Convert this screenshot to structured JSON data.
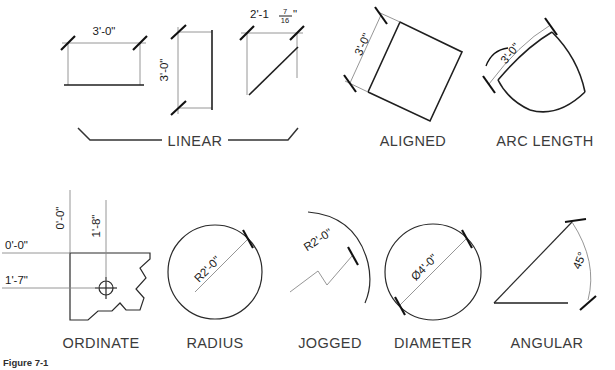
{
  "figure": {
    "caption": "Figure 7-1",
    "rows": [
      {
        "row_name": "top-row",
        "groups": [
          {
            "label": "LINEAR",
            "name": "linear",
            "dimensions": [
              {
                "value": "3'-0\"",
                "orientation": "horizontal",
                "name": "linear-horizontal-dim"
              },
              {
                "value": "3'-0\"",
                "orientation": "vertical",
                "name": "linear-vertical-dim"
              },
              {
                "value": "2'-1",
                "fraction_numerator": "7",
                "fraction_denominator": "16",
                "suffix": "\"",
                "orientation": "horizontal",
                "name": "linear-diagonal-dim"
              }
            ]
          },
          {
            "label": "ALIGNED",
            "name": "aligned",
            "dimensions": [
              {
                "value": "3'-0\"",
                "orientation": "rotated",
                "name": "aligned-dim"
              }
            ]
          },
          {
            "label": "ARC LENGTH",
            "name": "arc-length",
            "dimensions": [
              {
                "value": "3'-0\"",
                "orientation": "rotated",
                "symbol": "arc",
                "name": "arc-length-dim"
              }
            ]
          }
        ]
      },
      {
        "row_name": "bottom-row",
        "groups": [
          {
            "label": "ORDINATE",
            "name": "ordinate",
            "dimensions": [
              {
                "value": "0'-0\"",
                "orientation": "vertical",
                "name": "ordinate-y-origin-dim"
              },
              {
                "value": "1'-8\"",
                "orientation": "vertical",
                "name": "ordinate-y-offset-dim"
              },
              {
                "value": "0'-0\"",
                "orientation": "horizontal",
                "name": "ordinate-x-origin-dim"
              },
              {
                "value": "1'-7\"",
                "orientation": "horizontal",
                "name": "ordinate-x-offset-dim"
              }
            ]
          },
          {
            "label": "RADIUS",
            "name": "radius",
            "dimensions": [
              {
                "value": "R2'-0\"",
                "orientation": "rotated",
                "name": "radius-dim"
              }
            ]
          },
          {
            "label": "JOGGED",
            "name": "jogged",
            "dimensions": [
              {
                "value": "R2'-0\"",
                "orientation": "rotated",
                "name": "jogged-dim"
              }
            ]
          },
          {
            "label": "DIAMETER",
            "name": "diameter",
            "dimensions": [
              {
                "value": "Ø4'-0\"",
                "orientation": "rotated",
                "name": "diameter-dim"
              }
            ]
          },
          {
            "label": "ANGULAR",
            "name": "angular",
            "dimensions": [
              {
                "value": "45°",
                "orientation": "rotated",
                "name": "angular-dim"
              }
            ]
          }
        ]
      }
    ]
  },
  "colors": {
    "object_line": "#1f1f1f",
    "extension_line": "#8a8a8a",
    "tick": "#111111",
    "label_text": "#3b3b3b",
    "background": "#ffffff"
  }
}
